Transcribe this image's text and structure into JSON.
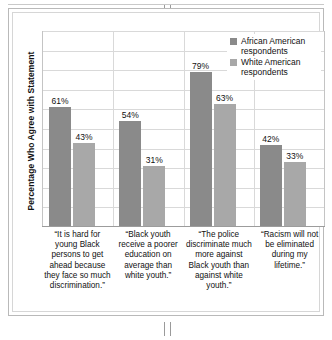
{
  "chart_data": {
    "type": "bar",
    "title": "",
    "xlabel": "",
    "ylabel": "Percentage Who Agree with Statement",
    "ylim": [
      0,
      100
    ],
    "grid": true,
    "legend_position": "top-right",
    "categories": [
      "“It is hard for young Black persons to get ahead because they face so much discrimination.”",
      "“Black youth receive a poorer education on average than white youth.”",
      "“The police discriminate much more against Black youth than against white youth.”",
      "“Racism will not be eliminated during my lifetime.”"
    ],
    "series": [
      {
        "name": "African American respondents",
        "color": "#8a8a8a",
        "values": [
          61,
          54,
          79,
          42
        ],
        "labels": [
          "61%",
          "54%",
          "79%",
          "42%"
        ]
      },
      {
        "name": "White American respondents",
        "color": "#a8a8a8",
        "values": [
          43,
          31,
          63,
          33
        ],
        "labels": [
          "43%",
          "31%",
          "63%",
          "33%"
        ]
      }
    ],
    "gridline_values": [
      10,
      20,
      30,
      40,
      50,
      60,
      70,
      80,
      90,
      100
    ]
  },
  "legend": {
    "items": [
      {
        "label": "African American respondents",
        "color": "#8a8a8a"
      },
      {
        "label": "White American respondents",
        "color": "#a8a8a8"
      }
    ]
  },
  "axis": {
    "y_title": "Percentage Who Agree with Statement"
  }
}
